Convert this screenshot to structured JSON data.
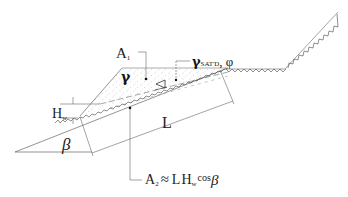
{
  "diagram": {
    "type": "infinite-slope-seepage",
    "labels": {
      "area1_main": "A",
      "area1_sub": "1",
      "unit_weight": "γ",
      "sat_unit_weight_main": "γ",
      "sat_unit_weight_sub": "SAT'D",
      "friction_angle": ", φ",
      "water_height_main": "H",
      "water_height_sub": "w",
      "length": "L",
      "slope_angle": "β",
      "area2_main": "A",
      "area2_sub": "2",
      "approx": "≈",
      "formula_L": "L",
      "formula_H": "H",
      "formula_Hsub": "w",
      "formula_cos": "cos",
      "formula_beta": "β"
    },
    "symbols": {
      "water_table": "water-table-triangle-icon"
    },
    "colors": {
      "line": "#555555",
      "ink": "#111111",
      "stipple": "#9a9a9a"
    }
  }
}
